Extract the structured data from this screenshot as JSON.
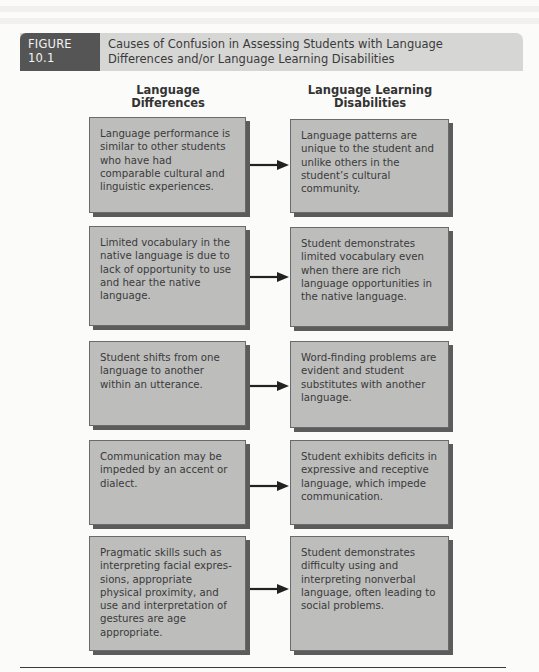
{
  "figure": {
    "label": "FIGURE 10.1",
    "title": "Causes of Confusion in Assessing Students with Language Differences and/or Language Learning Disabilities"
  },
  "columns": {
    "left_heading": "Language Differences",
    "right_heading": "Language Learning Disabilities"
  },
  "rows": [
    {
      "difference": "Language performance is similar to other students who have had comparable cultural and linguistic experiences.",
      "disability": "Language patterns are unique to the student and unlike others in the student’s cultural community."
    },
    {
      "difference": "Limited vocabulary in the native language is due to lack of opportunity to use and hear the native language.",
      "disability": "Student demonstrates limited vocabulary even when there are rich language opportunities in the native language."
    },
    {
      "difference": "Student shifts from one language to another within an utterance.",
      "disability": "Word-finding problems are evident and student substitutes with another language."
    },
    {
      "difference": "Communication may be impeded by an accent or dialect.",
      "disability": "Student exhibits deficits in expressive and receptive language, which impede communication."
    },
    {
      "difference": "Pragmatic skills such as interpreting facial expres­sions, appropriate physical proximity, and use and interpretation of gestures are age appropriate.",
      "disability": "Student demonstrates difficulty using and interpreting nonverbal language, often leading to social problems."
    }
  ],
  "colors": {
    "box_fill": "#bdbdbc",
    "box_shadow": "#5c5c5c",
    "header_band": "#d6d6d5",
    "header_label": "#555555"
  }
}
